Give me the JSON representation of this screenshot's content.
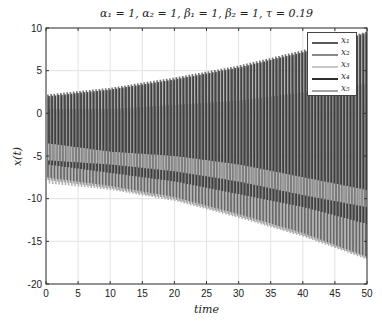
{
  "chart_data": {
    "type": "line",
    "title": "α₁ = 1, α₂ = 1, β₁ = 1, β₂ = 1, τ = 0.19",
    "xlabel": "time",
    "ylabel": "x(t)",
    "xlim": [
      0,
      50
    ],
    "ylim": [
      -20,
      10
    ],
    "xticks": [
      0,
      5,
      10,
      15,
      20,
      25,
      30,
      35,
      40,
      45,
      50
    ],
    "yticks": [
      10,
      5,
      0,
      -5,
      -10,
      -15,
      -20
    ],
    "grid": true,
    "legend_position": "upper right",
    "oscillation_period_approx": 0.5,
    "series": [
      {
        "name": "x1",
        "label": "x₁",
        "color": "#5a5a5a",
        "envelope_t": [
          0,
          10,
          20,
          30,
          40,
          50
        ],
        "upper": [
          2.2,
          3.0,
          4.2,
          5.6,
          7.4,
          9.6
        ],
        "lower": [
          -7.5,
          -8.5,
          -9.8,
          -11.8,
          -14.0,
          -16.8
        ]
      },
      {
        "name": "x2",
        "label": "x₂",
        "color": "#8a8a8a",
        "envelope_t": [
          0,
          10,
          20,
          30,
          40,
          50
        ],
        "upper": [
          1.8,
          2.6,
          3.8,
          5.2,
          7.0,
          9.2
        ],
        "lower": [
          -7.8,
          -8.8,
          -10.1,
          -12.1,
          -14.3,
          -17.0
        ]
      },
      {
        "name": "x3",
        "label": "x₃",
        "color": "#c8c8c8",
        "envelope_t": [
          0,
          10,
          20,
          30,
          40,
          50
        ],
        "upper": [
          -3.5,
          -4.5,
          -5.0,
          -6.0,
          -7.5,
          -9.0
        ],
        "lower": [
          -5.5,
          -6.0,
          -6.8,
          -8.0,
          -9.6,
          -11.0
        ]
      },
      {
        "name": "x4",
        "label": "x₄",
        "color": "#2e2e2e",
        "envelope_t": [
          0,
          10,
          20,
          30,
          40,
          50
        ],
        "upper": [
          2.0,
          2.8,
          4.0,
          5.4,
          7.2,
          9.5
        ],
        "lower": [
          -6.0,
          -7.0,
          -8.0,
          -9.5,
          -11.0,
          -13.0
        ]
      },
      {
        "name": "x5",
        "label": "x₅",
        "color": "#a5a5a5",
        "envelope_t": [
          0,
          10,
          20,
          30,
          40,
          50
        ],
        "upper": [
          0.5,
          0.5,
          1.0,
          1.5,
          2.5,
          3.5
        ],
        "lower": [
          -8.2,
          -9.0,
          -10.3,
          -12.3,
          -14.5,
          -17.2
        ]
      }
    ]
  },
  "legend": {
    "items": [
      {
        "label": "x₁",
        "color": "#5a5a5a"
      },
      {
        "label": "x₂",
        "color": "#8a8a8a"
      },
      {
        "label": "x₃",
        "color": "#c8c8c8"
      },
      {
        "label": "x₄",
        "color": "#2e2e2e"
      },
      {
        "label": "x₅",
        "color": "#a5a5a5"
      }
    ]
  },
  "labels": {
    "title": "α₁ = 1, α₂ = 1, β₁ = 1, β₂ = 1, τ = 0.19",
    "xlabel": "time",
    "ylabel": "x(t)"
  }
}
